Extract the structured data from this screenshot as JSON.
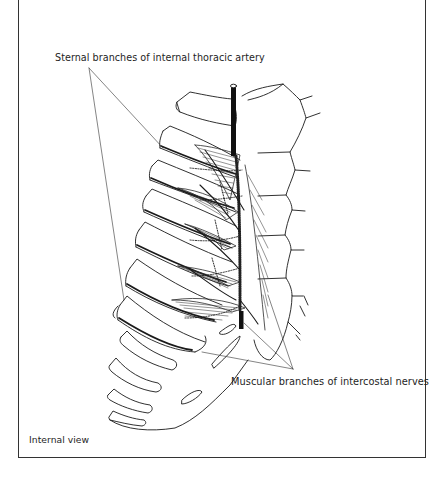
{
  "figure": {
    "labels": {
      "sternal_branches": "Sternal branches of internal thoracic artery",
      "muscular_branches": "Muscular branches of intercostal nerves",
      "view": "Internal view"
    },
    "colors": {
      "ink": "#1a1a1a",
      "background": "#ffffff",
      "frame": "#333333"
    }
  }
}
